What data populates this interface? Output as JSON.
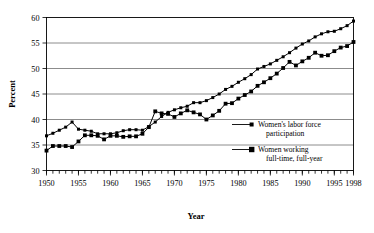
{
  "figure": {
    "background_color": "#ffffff",
    "line_color": "#000000",
    "grid_color": "#6e6e6e"
  },
  "chart_data": {
    "type": "line",
    "title": "",
    "xlabel": "Year",
    "ylabel": "Percent",
    "xlim": [
      1950,
      1998
    ],
    "ylim": [
      30,
      60
    ],
    "ytick_labels": [
      "30",
      "35",
      "40",
      "45",
      "50",
      "55",
      "60"
    ],
    "yticks": [
      30,
      35,
      40,
      45,
      50,
      55,
      60
    ],
    "xtick_labels": [
      "1950",
      "1955",
      "1960",
      "1965",
      "1970",
      "1975",
      "1980",
      "1985",
      "1990",
      "1995",
      "1998"
    ],
    "xticks": [
      1950,
      1955,
      1960,
      1965,
      1970,
      1975,
      1980,
      1985,
      1990,
      1995,
      1998
    ],
    "minor_xtick_interval": 1,
    "grid": "horizontal",
    "legend_position": "inside-right-lower",
    "x": [
      1950,
      1951,
      1952,
      1953,
      1954,
      1955,
      1956,
      1957,
      1958,
      1959,
      1960,
      1961,
      1962,
      1963,
      1964,
      1965,
      1966,
      1967,
      1968,
      1969,
      1970,
      1971,
      1972,
      1973,
      1974,
      1975,
      1976,
      1977,
      1978,
      1979,
      1980,
      1981,
      1982,
      1983,
      1984,
      1985,
      1986,
      1987,
      1988,
      1989,
      1990,
      1991,
      1992,
      1993,
      1994,
      1995,
      1996,
      1997,
      1998
    ],
    "series": [
      {
        "name": "Women's labor force participation",
        "marker": "square",
        "values": [
          36.8,
          37.3,
          37.9,
          38.5,
          39.5,
          38.1,
          37.9,
          37.7,
          37.2,
          37.2,
          37.2,
          37.4,
          37.8,
          38.0,
          38.0,
          37.9,
          38.6,
          39.5,
          40.6,
          41.4,
          41.9,
          42.3,
          42.6,
          43.3,
          43.3,
          43.7,
          44.3,
          45.0,
          45.9,
          46.5,
          47.3,
          48.0,
          48.8,
          49.9,
          50.4,
          50.9,
          51.6,
          52.3,
          53.1,
          54.0,
          54.8,
          55.4,
          56.2,
          56.8,
          57.2,
          57.3,
          57.8,
          58.4,
          59.3
        ]
      },
      {
        "name": "Women working full-time, full-year",
        "marker": "square",
        "values": [
          33.9,
          34.8,
          34.8,
          34.8,
          34.6,
          35.7,
          36.9,
          36.9,
          36.8,
          36.1,
          36.8,
          36.8,
          36.6,
          36.7,
          36.7,
          37.2,
          38.5,
          41.6,
          41.2,
          41.1,
          40.5,
          41.2,
          41.8,
          41.4,
          41.0,
          40.0,
          40.8,
          41.7,
          43.1,
          43.2,
          44.1,
          44.8,
          45.5,
          46.6,
          47.3,
          48.1,
          49.0,
          50.1,
          51.3,
          50.6,
          51.4,
          52.1,
          53.1,
          52.5,
          52.6,
          53.4,
          54.1,
          54.4,
          55.2
        ]
      }
    ]
  },
  "legend": {
    "entries": [
      {
        "label_line1": "Women's labor force",
        "label_line2": "participation"
      },
      {
        "label_line1": "Women working",
        "label_line2": "full-time, full-year"
      }
    ]
  }
}
